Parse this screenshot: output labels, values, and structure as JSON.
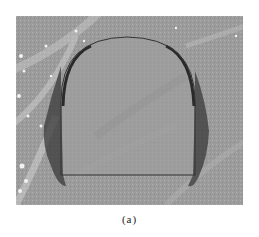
{
  "figure": {
    "panel_label": "(a)",
    "colors": {
      "rock_background": "#9a9a9a",
      "rock_light": "#d8d8d8",
      "rock_dark": "#808080",
      "outline": "#333333",
      "damage_zone": "#3a3a3a"
    }
  }
}
